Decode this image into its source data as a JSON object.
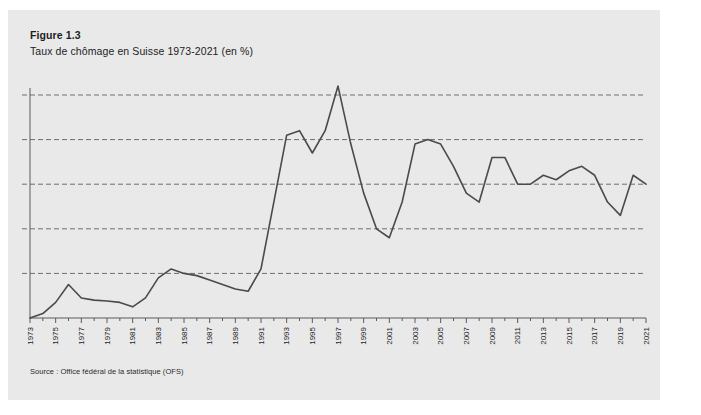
{
  "figure": {
    "number": "Figure 1.3",
    "title": "Taux de chômage en Suisse 1973-2021 (en %)",
    "source": "Source : Office fédéral de la statistique (OFS)"
  },
  "style": {
    "panel_bg": "#e9e9e9",
    "page_bg": "#ffffff",
    "line_color": "#4a4a4a",
    "grid_color": "#6e6e6e",
    "axis_color": "#5a5a5a",
    "text_color": "#1d1d1d"
  },
  "chart_data": {
    "type": "line",
    "title": "Taux de chômage en Suisse 1973-2021 (en %)",
    "xlabel": "",
    "ylabel": "",
    "ylim": [
      0,
      5.5
    ],
    "xlim": [
      1973,
      2021
    ],
    "grid": true,
    "grid_axis": "y",
    "grid_style": "dashed",
    "yticks": [
      0,
      1,
      2,
      3,
      4,
      5
    ],
    "ytick_labels_visible": false,
    "legend": false,
    "xtick_labels": [
      "1973",
      "1975",
      "1977",
      "1979",
      "1981",
      "1983",
      "1985",
      "1987",
      "1989",
      "1991",
      "1993",
      "1995",
      "1997",
      "1999",
      "2001",
      "2003",
      "2005",
      "2007",
      "2009",
      "2011",
      "2013",
      "2015",
      "2017",
      "2019",
      "2021"
    ],
    "xtick_label_rotation": 90,
    "x": [
      1973,
      1974,
      1975,
      1976,
      1977,
      1978,
      1979,
      1980,
      1981,
      1982,
      1983,
      1984,
      1985,
      1986,
      1987,
      1988,
      1989,
      1990,
      1991,
      1992,
      1993,
      1994,
      1995,
      1996,
      1997,
      1998,
      1999,
      2000,
      2001,
      2002,
      2003,
      2004,
      2005,
      2006,
      2007,
      2008,
      2009,
      2010,
      2011,
      2012,
      2013,
      2014,
      2015,
      2016,
      2017,
      2018,
      2019,
      2020,
      2021
    ],
    "series": [
      {
        "name": "Taux de chômage",
        "values": [
          0.0,
          0.1,
          0.35,
          0.75,
          0.45,
          0.4,
          0.38,
          0.35,
          0.25,
          0.45,
          0.9,
          1.1,
          1.0,
          0.95,
          0.85,
          0.75,
          0.65,
          0.6,
          1.1,
          2.6,
          4.1,
          4.2,
          3.7,
          4.2,
          5.2,
          3.9,
          2.8,
          2.0,
          1.8,
          2.6,
          3.9,
          4.0,
          3.9,
          3.4,
          2.8,
          2.6,
          3.6,
          3.6,
          3.0,
          3.0,
          3.2,
          3.1,
          3.3,
          3.4,
          3.2,
          2.6,
          2.3,
          3.2,
          3.0
        ]
      }
    ]
  }
}
